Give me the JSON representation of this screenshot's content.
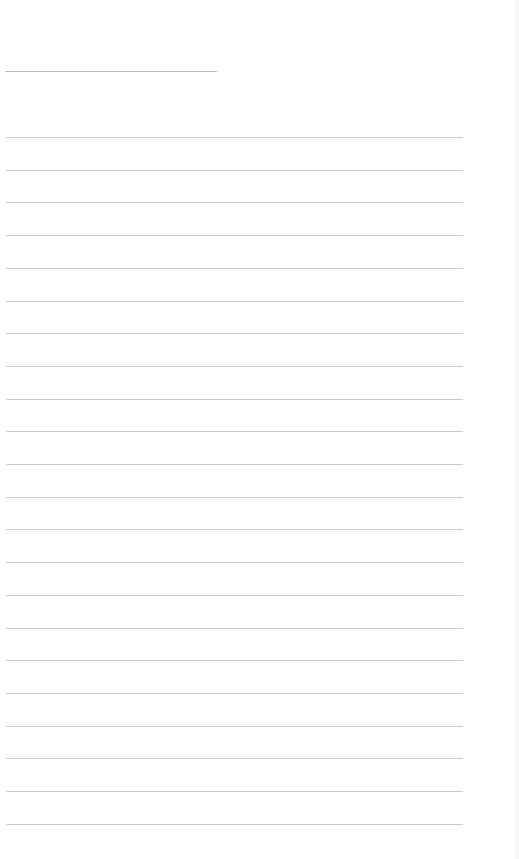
{
  "document": {
    "type": "blank lined notebook page",
    "title_line": {
      "x": 5,
      "y": 71,
      "width": 212
    },
    "ruled_lines": {
      "count": 22,
      "start_y": 137,
      "spacing": 32.7,
      "x": 6,
      "width": 457,
      "color": "#c9c9c9"
    },
    "text": ""
  }
}
